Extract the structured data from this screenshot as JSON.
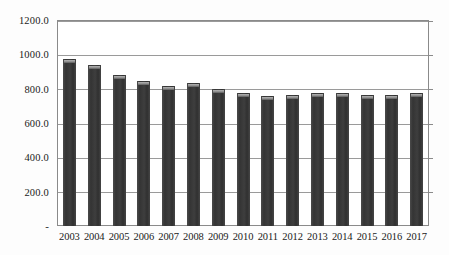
{
  "chart_data": {
    "type": "bar",
    "title": "",
    "subtitle": "",
    "xlabel": "",
    "ylabel": "",
    "categories": [
      "2003",
      "2004",
      "2005",
      "2006",
      "2007",
      "2008",
      "2009",
      "2010",
      "2011",
      "2012",
      "2013",
      "2014",
      "2015",
      "2016",
      "2017"
    ],
    "values": [
      975,
      937,
      880,
      843,
      815,
      833,
      800,
      775,
      757,
      762,
      775,
      775,
      765,
      765,
      775
    ],
    "series": [
      {
        "name": "",
        "values": [
          975,
          937,
          880,
          843,
          815,
          833,
          800,
          775,
          757,
          762,
          775,
          775,
          765,
          765,
          775
        ]
      }
    ],
    "ylim": [
      0,
      1200
    ],
    "y_ticks": [
      0,
      200,
      400,
      600,
      800,
      1000,
      1200
    ],
    "y_tick_labels": [
      "-",
      "200.0",
      "400.0",
      "600.0",
      "800.0",
      "1000.0",
      "1200.0"
    ],
    "grid": true,
    "grid_axis": "y",
    "legend": false,
    "legend_position": "none",
    "bar_color": "#3c3c3c",
    "grid_color": "#9a9a9a",
    "axis_color": "#8a8a8a",
    "background_color": "#ffffff"
  }
}
